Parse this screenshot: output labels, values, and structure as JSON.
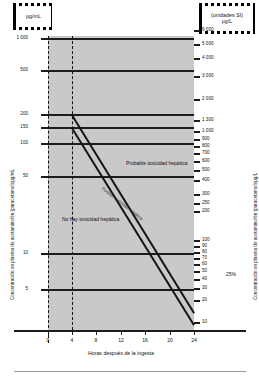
{
  "units": {
    "left_box": {
      "line1": "µg/mL"
    },
    "right_box": {
      "line1": "(unidades SI)",
      "line2": "µg/L"
    }
  },
  "axes": {
    "y_left_title": "Concentración en plasma de acetaminofén (paracetamol)/µg/mL",
    "y_right_title": "Concentración en plasma de acetaminofén (paracetamol)/µg/L",
    "x_title": "Horas después de la ingesta"
  },
  "annotations": {
    "probable": "Probable toxicidad hepática",
    "posible": "Posible toxicidad hepática",
    "none": "No hay toxicidad hepática",
    "percent": "25%"
  },
  "chart_data": {
    "type": "line",
    "xlabel": "Horas después de la ingesta",
    "ylabel": "Concentración en plasma de acetaminofén (paracetamol)/µg/mL",
    "ylabel_right": "Concentración en plasma de acetaminofén (paracetamol)/µg/L",
    "scale": "semilog",
    "xlim": [
      0,
      24
    ],
    "ylim": [
      5,
      1000
    ],
    "grid": false,
    "legend": "none",
    "x_ticks": [
      0,
      4,
      8,
      12,
      16,
      20,
      24
    ],
    "y_ticks_left": [
      1000,
      500,
      200,
      150,
      100,
      50,
      10,
      5
    ],
    "y_ticks_right": [
      6000,
      5000,
      4000,
      3000,
      2000,
      1300,
      1000,
      900,
      800,
      700,
      600,
      500,
      400,
      300,
      250,
      200,
      100,
      90,
      80,
      70,
      60,
      50,
      40,
      30,
      20,
      10
    ],
    "gridlines_y": [
      1000,
      500,
      200,
      150,
      100,
      50,
      10,
      5
    ],
    "vertical_marker_x": 4,
    "series": [
      {
        "name": "Probable toxicidad hepática (línea superior)",
        "x": [
          4,
          24
        ],
        "values": [
          200,
          12.5
        ]
      },
      {
        "name": "Posible toxicidad hepática (línea de tratamiento, 25%)",
        "x": [
          4,
          24
        ],
        "values": [
          150,
          9.4
        ]
      }
    ],
    "annotations": [
      {
        "text": "Probable toxicidad hepática",
        "x": 15,
        "y": 300
      },
      {
        "text": "Posible toxicidad hepática",
        "x": 12,
        "y": 55
      },
      {
        "text": "No hay toxicidad hepática",
        "x": 6,
        "y": 16
      },
      {
        "text": "25%",
        "x": 24,
        "y": 8
      }
    ]
  },
  "ticks": {
    "left": [
      {
        "label": "1 000",
        "y": 2
      },
      {
        "label": "500",
        "y": 34
      },
      {
        "label": "200",
        "y": 78
      },
      {
        "label": "150",
        "y": 91
      },
      {
        "label": "100",
        "y": 107
      },
      {
        "label": "50",
        "y": 140
      },
      {
        "label": "10",
        "y": 217
      },
      {
        "label": "5",
        "y": 253
      }
    ],
    "right": [
      {
        "label": "6 000",
        "y": 30
      },
      {
        "label": "5 000",
        "y": 44
      },
      {
        "label": "4 000",
        "y": 58
      },
      {
        "label": "3 000",
        "y": 76
      },
      {
        "label": "2 000",
        "y": 99
      },
      {
        "label": "1 300",
        "y": 120
      },
      {
        "label": "1 000",
        "y": 131
      },
      {
        "label": "900",
        "y": 139
      },
      {
        "label": "800",
        "y": 146
      },
      {
        "label": "700",
        "y": 153
      },
      {
        "label": "600",
        "y": 161
      },
      {
        "label": "500",
        "y": 170
      },
      {
        "label": "400",
        "y": 180
      },
      {
        "label": "300",
        "y": 194
      },
      {
        "label": "250",
        "y": 203
      },
      {
        "label": "200",
        "y": 211
      },
      {
        "label": "100",
        "y": 240
      },
      {
        "label": "90",
        "y": 246
      },
      {
        "label": "80",
        "y": 252
      },
      {
        "label": "70",
        "y": 258
      },
      {
        "label": "60",
        "y": 264
      },
      {
        "label": "50",
        "y": 271
      },
      {
        "label": "40",
        "y": 279
      },
      {
        "label": "30",
        "y": 288
      },
      {
        "label": "20",
        "y": 300
      },
      {
        "label": "10",
        "y": 322
      }
    ],
    "x": [
      {
        "label": "0",
        "x": 48
      },
      {
        "label": "4",
        "x": 72
      },
      {
        "label": "8",
        "x": 96
      },
      {
        "label": "12",
        "x": 121
      },
      {
        "label": "16",
        "x": 145
      },
      {
        "label": "20",
        "x": 170
      },
      {
        "label": "24",
        "x": 194
      }
    ],
    "gridlines": [
      {
        "y": 2
      },
      {
        "y": 34
      },
      {
        "y": 78
      },
      {
        "y": 91
      },
      {
        "y": 107
      },
      {
        "y": 140
      },
      {
        "y": 217
      },
      {
        "y": 253
      }
    ]
  },
  "colors": {
    "plot_background": "#c9c9c9",
    "line": "#141414",
    "text": "#111111",
    "page_background": "#ffffff"
  }
}
